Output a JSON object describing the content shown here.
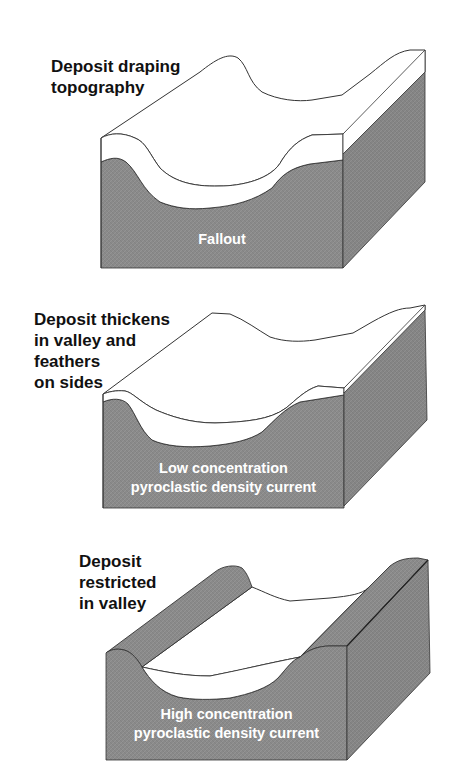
{
  "figure": {
    "panels": [
      {
        "id": "fallout",
        "side_label": "Deposit draping\ntopography",
        "block_label": "Fallout"
      },
      {
        "id": "low-concentration-pdc",
        "side_label": "Deposit thickens\nin valley and\nfeathers\non sides",
        "block_label": "Low concentration\npyroclastic density current"
      },
      {
        "id": "high-concentration-pdc",
        "side_label": "Deposit\nrestricted\nin valley",
        "block_label": "High concentration\npyroclastic density current"
      }
    ],
    "colors": {
      "bedrock": "#8a8a8a",
      "bedrock_side": "#7e7e7e",
      "deposit": "#ffffff",
      "outline": "#333333",
      "label_text": "#111111",
      "inner_text": "#ffffff"
    }
  }
}
